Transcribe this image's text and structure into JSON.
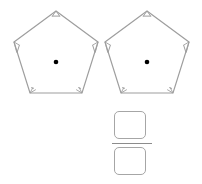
{
  "worksheet": {
    "figures": [
      {
        "name": "pentagon-left",
        "shape": "regular-pentagon",
        "vertices": 5,
        "center_dot": true,
        "angle_marks": 5,
        "fill": "#ffffff",
        "stroke": "#9e9e9e",
        "dot_color": "#000000"
      },
      {
        "name": "pentagon-right",
        "shape": "regular-pentagon",
        "vertices": 5,
        "center_dot": true,
        "angle_marks": 5,
        "fill": "#ffffff",
        "stroke": "#9e9e9e",
        "dot_color": "#000000"
      }
    ],
    "equation": {
      "expression": "2÷5=",
      "dividend": "2",
      "divisor": "5",
      "operator": "÷",
      "equals": "=",
      "answer": {
        "type": "fraction",
        "numerator": "",
        "denominator": "",
        "numerator_placeholder": "",
        "denominator_placeholder": ""
      }
    },
    "colors": {
      "text": "#2b2b2b",
      "outline": "#9e9e9e",
      "box_outline": "#a6a6a6",
      "bar": "#8c8c8c",
      "background": "#ffffff"
    }
  }
}
